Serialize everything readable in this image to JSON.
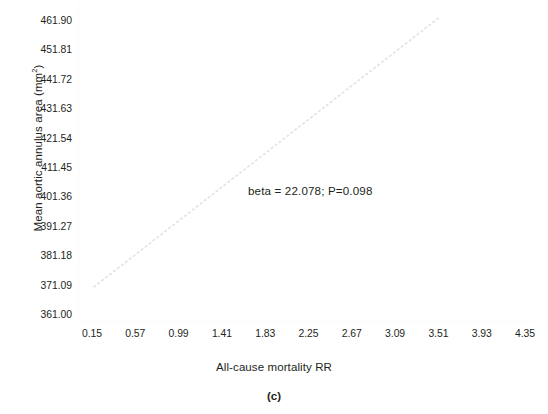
{
  "chart_data": {
    "type": "line",
    "title": "",
    "subtitle": "",
    "panel_label": "(c)",
    "xlabel": "All-cause mortality RR",
    "ylabel": "Mean aortic annulus area (mm²)",
    "ylabel_main": "Mean aortic annulus area (mm",
    "ylabel_sup": "2",
    "ylabel_tail": ")",
    "x_ticks": [
      "0.15",
      "0.57",
      "0.99",
      "1.41",
      "1.83",
      "2.25",
      "2.67",
      "3.09",
      "3.51",
      "3.93",
      "4.35"
    ],
    "y_ticks": [
      "461.90",
      "451.81",
      "441.72",
      "431.63",
      "421.54",
      "411.45",
      "401.36",
      "391.27",
      "381.18",
      "371.09",
      "361.00"
    ],
    "xlim": [
      0.15,
      4.35
    ],
    "ylim": [
      361.0,
      461.9
    ],
    "grid": false,
    "legend": "none",
    "annotations": [
      {
        "name": "regression-stats",
        "text": "beta = 22.078; P=0.098",
        "beta": 22.078,
        "p_value": 0.098,
        "x": 2.05,
        "y": 409.0
      }
    ],
    "series": [
      {
        "name": "regression-line",
        "style": "dotted",
        "color": "#e2e2e6",
        "x": [
          0.17,
          3.52
        ],
        "y": [
          371.0,
          463.5
        ],
        "slope": 22.078,
        "intercept": 367.25
      }
    ]
  },
  "axis": {
    "y_tick_color": "#231f20",
    "x_tick_color": "#231f20",
    "line_color": "#fbfbfb"
  },
  "colors": {
    "background": "#ffffff",
    "text": "#231f20",
    "trend_line": "#e2e2e6"
  }
}
